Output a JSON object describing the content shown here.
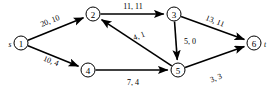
{
  "figure": {
    "kind": "flow-network-diagram",
    "width": 277,
    "height": 91,
    "background_color": "#ffffff",
    "stroke_color": "#000000"
  },
  "nodes": [
    {
      "id": "1",
      "label": "1",
      "terminal": "s",
      "terminal_side": "left",
      "x": 21,
      "y": 43,
      "r": 7
    },
    {
      "id": "2",
      "label": "2",
      "terminal": "",
      "terminal_side": "",
      "x": 93,
      "y": 14,
      "r": 7
    },
    {
      "id": "3",
      "label": "3",
      "terminal": "",
      "terminal_side": "",
      "x": 174,
      "y": 14,
      "r": 7
    },
    {
      "id": "4",
      "label": "4",
      "terminal": "",
      "terminal_side": "",
      "x": 88,
      "y": 70,
      "r": 7
    },
    {
      "id": "5",
      "label": "5",
      "terminal": "",
      "terminal_side": "",
      "x": 178,
      "y": 70,
      "r": 7
    },
    {
      "id": "6",
      "label": "6",
      "terminal": "t",
      "terminal_side": "right",
      "x": 254,
      "y": 43,
      "r": 7
    }
  ],
  "edges": [
    {
      "from": "1",
      "to": "2",
      "label": "20, 10",
      "capacity": 20,
      "flow": 10,
      "label_x": 50,
      "label_y": 21,
      "label_rotate": -22
    },
    {
      "from": "1",
      "to": "4",
      "label": "10, 4",
      "capacity": 10,
      "flow": 4,
      "label_x": 51,
      "label_y": 61,
      "label_rotate": 21
    },
    {
      "from": "2",
      "to": "3",
      "label": "11, 11",
      "capacity": 11,
      "flow": 11,
      "label_x": 133,
      "label_y": 6,
      "label_rotate": 0
    },
    {
      "from": "3",
      "to": "6",
      "label": "13, 11",
      "capacity": 13,
      "flow": 11,
      "label_x": 215,
      "label_y": 21,
      "label_rotate": 21
    },
    {
      "from": "3",
      "to": "5",
      "label": "5, 0",
      "capacity": 5,
      "flow": 0,
      "label_x": 190,
      "label_y": 41,
      "label_rotate": 0
    },
    {
      "from": "5",
      "to": "2",
      "label": "4, 1",
      "capacity": 4,
      "flow": 1,
      "label_x": 139,
      "label_y": 36,
      "label_rotate": -22
    },
    {
      "from": "4",
      "to": "5",
      "label": "7, 4",
      "capacity": 7,
      "flow": 4,
      "label_x": 133,
      "label_y": 82,
      "label_rotate": 0
    },
    {
      "from": "5",
      "to": "6",
      "label": "3, 3",
      "capacity": 3,
      "flow": 3,
      "label_x": 216,
      "label_y": 78,
      "label_rotate": -21
    }
  ]
}
